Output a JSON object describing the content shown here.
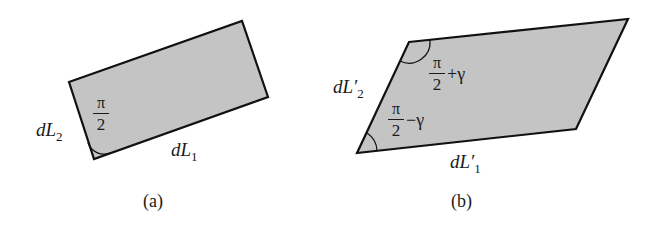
{
  "diagram": {
    "colors": {
      "fill": "#c4c4c4",
      "stroke": "#111111",
      "background": "#ffffff"
    },
    "panel_a": {
      "caption": "(a)",
      "shape": "rectangle",
      "vertices": [
        [
          69,
          82
        ],
        [
          242,
          21
        ],
        [
          268,
          97
        ],
        [
          94,
          159
        ]
      ],
      "angle_label": {
        "numerator": "π",
        "denominator": "2",
        "suffix": ""
      },
      "side_label_left": {
        "main": "dL",
        "sub": "2"
      },
      "side_label_bottom": {
        "main": "dL",
        "sub": "1"
      }
    },
    "panel_b": {
      "caption": "(b)",
      "shape": "parallelogram",
      "vertices": [
        [
          409,
          42
        ],
        [
          628,
          19
        ],
        [
          576,
          129
        ],
        [
          357,
          153
        ]
      ],
      "angle_label_top": {
        "numerator": "π",
        "denominator": "2",
        "suffix": "+γ"
      },
      "angle_label_bottom": {
        "numerator": "π",
        "denominator": "2",
        "suffix": "−γ"
      },
      "side_label_left": {
        "main": "dL′",
        "sub": "2"
      },
      "side_label_bottom": {
        "main": "dL′",
        "sub": "1"
      }
    }
  }
}
